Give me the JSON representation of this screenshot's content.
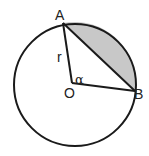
{
  "diagram": {
    "type": "circle-segment",
    "labels": {
      "point_a": "A",
      "point_b": "B",
      "center": "O",
      "radius": "r",
      "angle": "α"
    },
    "colors": {
      "stroke": "#1a1a1a",
      "segment_fill": "#c8c8c8",
      "background": "#ffffff"
    }
  }
}
